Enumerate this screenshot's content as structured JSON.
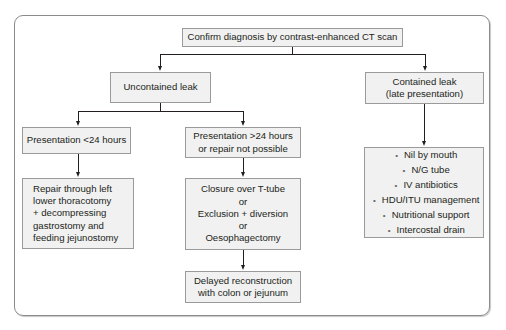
{
  "flowchart": {
    "root": {
      "text": "Confirm diagnosis by contrast-enhanced CT scan"
    },
    "uncontained": {
      "text": "Uncontained leak"
    },
    "contained": {
      "lines": [
        "Contained leak",
        "(late presentation)"
      ]
    },
    "presentation_lt24": {
      "text": "Presentation <24 hours"
    },
    "presentation_gt24": {
      "lines": [
        "Presentation >24 hours",
        "or repair not possible"
      ]
    },
    "repair": {
      "lines": [
        "Repair through left",
        "lower thoracotomy",
        "+ decompressing",
        "gastrostomy and",
        "feeding jejunostomy"
      ]
    },
    "closure": {
      "lines": [
        "Closure over T-tube",
        "or",
        "Exclusion + diversion",
        "or",
        "Oesophagectomy"
      ]
    },
    "delayed": {
      "lines": [
        "Delayed reconstruction",
        "with colon or jejunum"
      ]
    },
    "conservative": {
      "items": [
        "Nil by mouth",
        "N/G tube",
        "IV antibiotics",
        "HDU/ITU management",
        "Nutritional support",
        "Intercostal drain"
      ]
    }
  },
  "colors": {
    "box_fill": "#f1f1f1",
    "box_border": "#9a9a9a",
    "line": "#231f20",
    "frame": "#8a8a8a"
  }
}
